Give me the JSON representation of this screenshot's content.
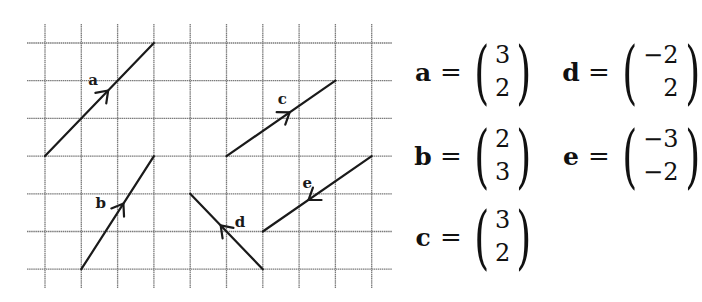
{
  "diagram": {
    "grid": {
      "columns": 10,
      "rows": 7,
      "line_color": "#7a7a7a",
      "vector_color": "#1a1a1a"
    },
    "vectors": [
      {
        "name": "a",
        "label": "a",
        "start": [
          0,
          3
        ],
        "end": [
          3,
          0
        ]
      },
      {
        "name": "b",
        "label": "b",
        "start": [
          1,
          6
        ],
        "end": [
          3,
          3
        ]
      },
      {
        "name": "c",
        "label": "c",
        "start": [
          5,
          3
        ],
        "end": [
          8,
          1
        ]
      },
      {
        "name": "d",
        "label": "d",
        "start": [
          6,
          6
        ],
        "end": [
          4,
          4
        ]
      },
      {
        "name": "e",
        "label": "e",
        "start": [
          9,
          3
        ],
        "end": [
          6,
          5
        ]
      }
    ]
  },
  "equations": [
    {
      "name": "a",
      "equals": "=",
      "x": "3",
      "y": "2"
    },
    {
      "name": "b",
      "equals": "=",
      "x": "2",
      "y": "3"
    },
    {
      "name": "c",
      "equals": "=",
      "x": "3",
      "y": "2"
    },
    {
      "name": "d",
      "equals": "=",
      "x": "−2",
      "y": "2"
    },
    {
      "name": "e",
      "equals": "=",
      "x": "−3",
      "y": "−2"
    }
  ]
}
